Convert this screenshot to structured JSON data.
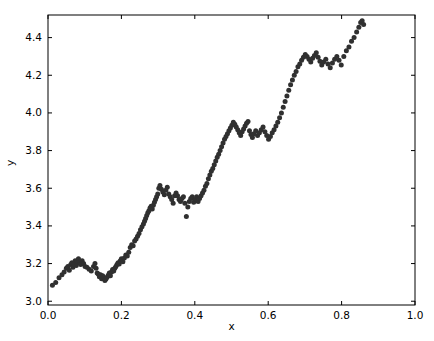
{
  "figure": {
    "background_color": "#ffffff",
    "width": 434,
    "height": 341
  },
  "chart_data": {
    "type": "scatter",
    "title": "",
    "xlabel": "x",
    "ylabel": "y",
    "xlim": [
      0.0,
      1.0
    ],
    "ylim": [
      2.98,
      4.52
    ],
    "grid": false,
    "legend": null,
    "marker": {
      "shape": "circle",
      "color": "#303030",
      "size_px": 5
    },
    "xticks": [
      0.0,
      0.2,
      0.4,
      0.6,
      0.8,
      1.0
    ],
    "xticklabels": [
      "0.0",
      "0.2",
      "0.4",
      "0.6",
      "0.8",
      "1.0"
    ],
    "yticks": [
      3.0,
      3.2,
      3.4,
      3.6,
      3.8,
      4.0,
      4.2,
      4.4
    ],
    "yticklabels": [
      "3.0",
      "3.2",
      "3.4",
      "3.6",
      "3.8",
      "4.0",
      "4.2",
      "4.4"
    ],
    "n_points": 200,
    "x": [
      0.012,
      0.021,
      0.03,
      0.038,
      0.044,
      0.05,
      0.054,
      0.058,
      0.062,
      0.065,
      0.068,
      0.071,
      0.074,
      0.077,
      0.08,
      0.083,
      0.086,
      0.089,
      0.093,
      0.097,
      0.101,
      0.106,
      0.112,
      0.118,
      0.124,
      0.128,
      0.131,
      0.134,
      0.137,
      0.14,
      0.143,
      0.146,
      0.149,
      0.152,
      0.155,
      0.158,
      0.161,
      0.164,
      0.167,
      0.17,
      0.173,
      0.176,
      0.179,
      0.182,
      0.185,
      0.188,
      0.191,
      0.194,
      0.197,
      0.2,
      0.204,
      0.208,
      0.212,
      0.216,
      0.22,
      0.224,
      0.228,
      0.232,
      0.236,
      0.24,
      0.244,
      0.248,
      0.252,
      0.256,
      0.26,
      0.263,
      0.266,
      0.269,
      0.272,
      0.275,
      0.278,
      0.281,
      0.284,
      0.287,
      0.29,
      0.293,
      0.296,
      0.299,
      0.302,
      0.305,
      0.309,
      0.313,
      0.317,
      0.321,
      0.325,
      0.329,
      0.333,
      0.337,
      0.341,
      0.345,
      0.349,
      0.353,
      0.357,
      0.361,
      0.365,
      0.369,
      0.373,
      0.377,
      0.381,
      0.385,
      0.389,
      0.393,
      0.397,
      0.401,
      0.405,
      0.409,
      0.413,
      0.417,
      0.421,
      0.425,
      0.429,
      0.433,
      0.437,
      0.441,
      0.445,
      0.449,
      0.453,
      0.457,
      0.461,
      0.465,
      0.469,
      0.473,
      0.477,
      0.481,
      0.485,
      0.489,
      0.493,
      0.497,
      0.501,
      0.505,
      0.509,
      0.513,
      0.517,
      0.521,
      0.525,
      0.529,
      0.533,
      0.537,
      0.541,
      0.545,
      0.549,
      0.553,
      0.557,
      0.561,
      0.566,
      0.571,
      0.576,
      0.581,
      0.586,
      0.591,
      0.596,
      0.601,
      0.606,
      0.611,
      0.616,
      0.621,
      0.626,
      0.631,
      0.636,
      0.641,
      0.646,
      0.651,
      0.656,
      0.661,
      0.666,
      0.671,
      0.676,
      0.681,
      0.686,
      0.691,
      0.696,
      0.701,
      0.706,
      0.711,
      0.716,
      0.721,
      0.726,
      0.731,
      0.736,
      0.741,
      0.746,
      0.751,
      0.757,
      0.763,
      0.769,
      0.775,
      0.781,
      0.787,
      0.793,
      0.799,
      0.806,
      0.813,
      0.82,
      0.827,
      0.834,
      0.841,
      0.847,
      0.852,
      0.856,
      0.86
    ],
    "y": [
      3.085,
      3.1,
      3.125,
      3.14,
      3.155,
      3.175,
      3.185,
      3.165,
      3.195,
      3.205,
      3.18,
      3.2,
      3.215,
      3.19,
      3.21,
      3.225,
      3.205,
      3.195,
      3.215,
      3.2,
      3.185,
      3.18,
      3.17,
      3.16,
      3.185,
      3.2,
      3.175,
      3.15,
      3.145,
      3.13,
      3.14,
      3.12,
      3.135,
      3.125,
      3.11,
      3.118,
      3.128,
      3.138,
      3.15,
      3.135,
      3.155,
      3.168,
      3.16,
      3.175,
      3.185,
      3.195,
      3.205,
      3.198,
      3.215,
      3.225,
      3.21,
      3.23,
      3.245,
      3.24,
      3.26,
      3.285,
      3.3,
      3.295,
      3.32,
      3.33,
      3.345,
      3.36,
      3.38,
      3.395,
      3.41,
      3.425,
      3.44,
      3.455,
      3.47,
      3.48,
      3.495,
      3.505,
      3.49,
      3.51,
      3.525,
      3.54,
      3.555,
      3.57,
      3.6,
      3.615,
      3.595,
      3.58,
      3.565,
      3.59,
      3.605,
      3.57,
      3.555,
      3.54,
      3.52,
      3.56,
      3.575,
      3.56,
      3.54,
      3.53,
      3.545,
      3.555,
      3.52,
      3.45,
      3.5,
      3.53,
      3.545,
      3.555,
      3.525,
      3.54,
      3.555,
      3.53,
      3.545,
      3.56,
      3.575,
      3.59,
      3.61,
      3.625,
      3.65,
      3.67,
      3.69,
      3.705,
      3.725,
      3.745,
      3.765,
      3.78,
      3.8,
      3.82,
      3.84,
      3.86,
      3.875,
      3.89,
      3.905,
      3.92,
      3.935,
      3.95,
      3.94,
      3.925,
      3.91,
      3.895,
      3.88,
      3.9,
      3.915,
      3.93,
      3.945,
      3.955,
      3.905,
      3.885,
      3.87,
      3.89,
      3.905,
      3.88,
      3.895,
      3.91,
      3.925,
      3.9,
      3.88,
      3.86,
      3.875,
      3.895,
      3.91,
      3.93,
      3.95,
      3.975,
      4.0,
      4.03,
      4.06,
      4.09,
      4.12,
      4.15,
      4.175,
      4.2,
      4.22,
      4.245,
      4.26,
      4.28,
      4.295,
      4.31,
      4.3,
      4.285,
      4.27,
      4.29,
      4.305,
      4.32,
      4.295,
      4.275,
      4.255,
      4.27,
      4.285,
      4.26,
      4.24,
      4.265,
      4.285,
      4.3,
      4.28,
      4.255,
      4.3,
      4.33,
      4.35,
      4.38,
      4.4,
      4.43,
      4.455,
      4.48,
      4.49,
      4.47
    ]
  }
}
